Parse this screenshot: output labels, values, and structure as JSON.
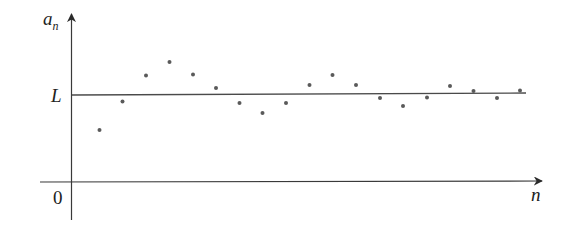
{
  "chart_data": {
    "type": "scatter",
    "title": "",
    "xlabel": "n",
    "ylabel": "a_n",
    "y_axis_label": {
      "main": "a",
      "subscript": "n"
    },
    "x_axis_label": "n",
    "origin_label": "0",
    "limit_label": "L",
    "limit_line": {
      "label": "L",
      "description": "horizontal line at the limit value L"
    },
    "grid": false,
    "legend": null,
    "x": [
      1,
      2,
      3,
      4,
      5,
      6,
      7,
      8,
      9,
      10,
      11,
      12,
      13,
      14,
      15,
      16,
      17,
      18,
      19
    ],
    "values_relative_to_L": [
      -0.41,
      -0.08,
      0.23,
      0.39,
      0.24,
      0.08,
      -0.1,
      -0.21,
      -0.1,
      0.12,
      0.24,
      0.12,
      -0.04,
      -0.13,
      -0.03,
      0.11,
      0.05,
      -0.04,
      0.05
    ],
    "pixel_points": [
      [
        99.5,
        130
      ],
      [
        122.5,
        101.5
      ],
      [
        146,
        75.5
      ],
      [
        169.5,
        62
      ],
      [
        193,
        74.5
      ],
      [
        216,
        88
      ],
      [
        239.5,
        103
      ],
      [
        262.5,
        113
      ],
      [
        286,
        103
      ],
      [
        309.5,
        85
      ],
      [
        332.5,
        75
      ],
      [
        356,
        85
      ],
      [
        380,
        98
      ],
      [
        403,
        106
      ],
      [
        427,
        97.5
      ],
      [
        450,
        86
      ],
      [
        473.5,
        91
      ],
      [
        497,
        98
      ],
      [
        520,
        90.5
      ]
    ]
  },
  "labels": {
    "y_main": "a",
    "y_sub": "n",
    "x": "n",
    "origin": "0",
    "limit": "L"
  }
}
